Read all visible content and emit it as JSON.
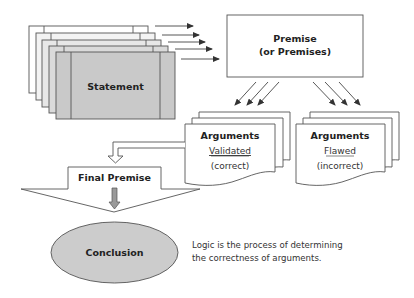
{
  "diagram": {
    "statement": {
      "label": "Statement",
      "layers": 5
    },
    "premise": {
      "line1": "Premise",
      "line2": "(or Premises)"
    },
    "arguments_validated": {
      "title": "Arguments",
      "status": "Validated",
      "note": "(correct)"
    },
    "arguments_flawed": {
      "title": "Arguments",
      "status": "Flawed",
      "note": "(incorrect)"
    },
    "final_premise": {
      "label": "Final Premise"
    },
    "conclusion": {
      "label": "Conclusion"
    },
    "caption": {
      "line1": "Logic is the process of determining",
      "line2": "the correctness of arguments."
    },
    "colors": {
      "statement_front": "#c9c9c9",
      "conclusion_fill": "#cccccc",
      "down_arrow_fill": "#9a9a9a",
      "stroke": "#555555"
    }
  }
}
